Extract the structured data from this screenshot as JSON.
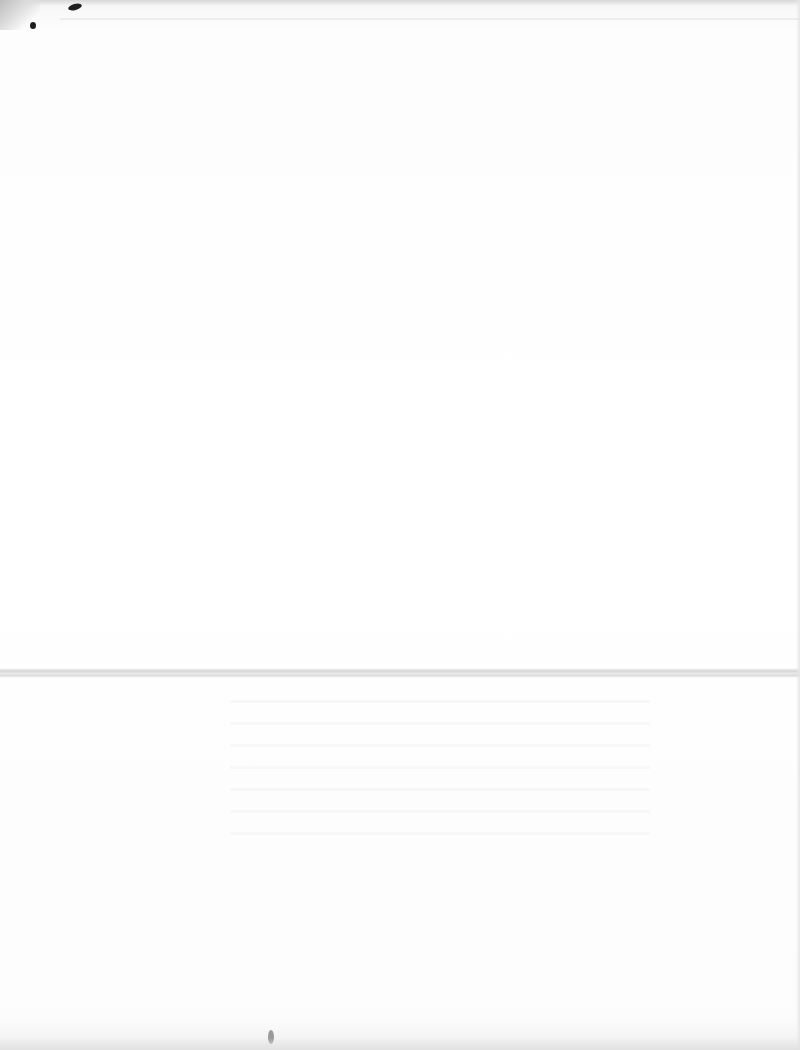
{
  "document": {
    "type": "scanned-page",
    "content": "",
    "features": [
      "fold-line",
      "ink-smudges",
      "faint-bleed-through"
    ]
  }
}
